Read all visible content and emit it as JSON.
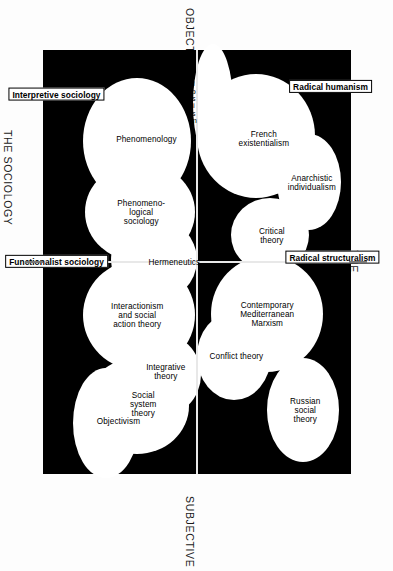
{
  "figure": {
    "axes": {
      "top_label": "OBJECTIVE",
      "bottom_label": "SUBJECTIVE",
      "left_label": "THE SOCIOLOGY\nOF RADICAL CHANGE",
      "right_label": "THE SOCIOLOGY\nOF REGULATION"
    },
    "quadrants": [
      {
        "id": "radical-structuralism",
        "tag": "Radical structuralism",
        "theories": [
          "Russian\nsocial\ntheory",
          "Contemporary\nMediterranean\nMarxism",
          "Conflict theory"
        ]
      },
      {
        "id": "functionalist-sociology",
        "tag": "Functionalist sociology",
        "theories": [
          "Objectivism",
          "Social\nsystem\ntheory",
          "Integrative\ntheory",
          "Interactionism\nand social\naction theory"
        ]
      },
      {
        "id": "radical-humanism",
        "tag": "Radical humanism",
        "theories": [
          "Anarchistic\nindividualism",
          "French\nexistentialism",
          "Critical\ntheory"
        ]
      },
      {
        "id": "interpretive-sociology",
        "tag": "Interpretive sociology",
        "theories": [
          "Hermeneutics",
          "Phenomeno-\nlogical\nsociology",
          "Phenomenology",
          "Solipsism"
        ]
      }
    ],
    "solipsism_letters": [
      "s",
      "o",
      "l",
      "i",
      "p",
      "s",
      "i",
      "s",
      "m"
    ],
    "colors": {
      "field": "#000000",
      "blob": "#ffffff",
      "axis": "#e8e8e8",
      "text": "#000000",
      "page": "#fdfdfd"
    }
  }
}
